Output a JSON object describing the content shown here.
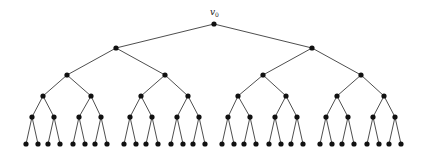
{
  "diagram": {
    "type": "binary-tree",
    "depth": 5,
    "root_label": "v",
    "root_label_subscript": "0",
    "colors": {
      "edge": "#3a3a3a",
      "node": "#111111",
      "background": "#ffffff"
    },
    "node_radius": 2.6,
    "levels": [
      {
        "y": 24,
        "x": [
          214
        ]
      },
      {
        "y": 48,
        "x": [
          116,
          312
        ]
      },
      {
        "y": 75,
        "x": [
          67,
          165,
          263,
          361
        ]
      },
      {
        "y": 96,
        "x": [
          43,
          91,
          141,
          188,
          238,
          286,
          337,
          384
        ]
      },
      {
        "y": 117,
        "x": [
          32,
          54,
          79,
          101,
          130,
          152,
          177,
          199,
          228,
          250,
          275,
          297,
          326,
          348,
          373,
          395
        ]
      },
      {
        "y": 144,
        "x": [
          26,
          38,
          48,
          60,
          73,
          85,
          95,
          107,
          124,
          136,
          146,
          158,
          171,
          183,
          193,
          205,
          222,
          234,
          244,
          256,
          269,
          281,
          291,
          303,
          320,
          332,
          342,
          354,
          367,
          379,
          389,
          401
        ]
      }
    ]
  }
}
